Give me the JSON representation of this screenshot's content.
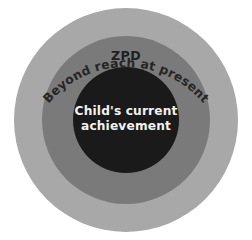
{
  "diagram": {
    "background_color": "#ffffff",
    "center": {
      "x": 126,
      "y": 120
    },
    "rings": [
      {
        "id": "outer",
        "name": "beyond-reach",
        "label": "Beyond reach at present",
        "radius": 112,
        "fill": "#a8a8a8",
        "text_color": "#262626",
        "label_style": "curved-top-arc"
      },
      {
        "id": "middle",
        "name": "zpd",
        "label": "ZPD",
        "radius": 84,
        "fill": "#7a7a7a",
        "text_color": "#1f1f1f",
        "label_style": "horizontal-top"
      },
      {
        "id": "inner",
        "name": "child-current-achievement",
        "label_line1": "Child's current",
        "label_line2": "achievement",
        "radius": 53,
        "fill": "#1a1a1a",
        "text_color": "#f2f2f2",
        "label_style": "centered-two-line"
      }
    ]
  }
}
